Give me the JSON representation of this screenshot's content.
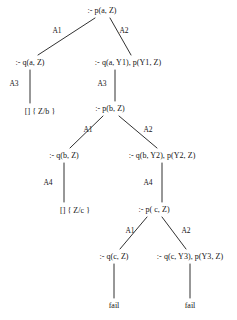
{
  "diagram": {
    "line_color": "#1a1a1a",
    "background_color": "#ffffff",
    "width": 237,
    "height": 320,
    "nodes": [
      {
        "id": "n0",
        "label": ":- p(a, Z)",
        "x": 102,
        "y": 10
      },
      {
        "id": "n1",
        "label": ":- q(a, Z)",
        "x": 30,
        "y": 62
      },
      {
        "id": "n2",
        "label": ":- q(a, Y1), p(Y1, Z)",
        "x": 128,
        "y": 62
      },
      {
        "id": "n3",
        "label": "[] { Z/b }",
        "x": 40,
        "y": 111
      },
      {
        "id": "n4",
        "label": ":- p(b, Z)",
        "x": 110,
        "y": 108
      },
      {
        "id": "n5",
        "label": ":- q(b, Z)",
        "x": 64,
        "y": 155
      },
      {
        "id": "n6",
        "label": ":- q(b, Y2), p(Y2, Z)",
        "x": 162,
        "y": 155
      },
      {
        "id": "n7",
        "label": "[] { Z/c }",
        "x": 75,
        "y": 210
      },
      {
        "id": "n8",
        "label": ":- p( c, Z)",
        "x": 154,
        "y": 209
      },
      {
        "id": "n9",
        "label": ":- q(c, Z)",
        "x": 114,
        "y": 256
      },
      {
        "id": "n10",
        "label": ":- q(c, Y3), p(Y3, Z)",
        "x": 190,
        "y": 256
      }
    ],
    "leaves": [
      {
        "id": "l0",
        "label": "fail",
        "x": 114,
        "y": 305
      },
      {
        "id": "l1",
        "label": "fail",
        "x": 190,
        "y": 305
      }
    ],
    "edges": [
      {
        "from": "n0",
        "to": "n1",
        "label": "A1",
        "lx": 57,
        "ly": 31,
        "x1": 95,
        "y1": 18,
        "x2": 38,
        "y2": 55
      },
      {
        "from": "n0",
        "to": "n2",
        "label": "A2",
        "lx": 124,
        "ly": 31,
        "x1": 110,
        "y1": 18,
        "x2": 131,
        "y2": 55
      },
      {
        "from": "n1",
        "to": "n3",
        "label": "A3",
        "lx": 14,
        "ly": 84,
        "x1": 30,
        "y1": 70,
        "x2": 30,
        "y2": 103
      },
      {
        "from": "n2",
        "to": "n4",
        "label": "A3",
        "lx": 102,
        "ly": 84,
        "x1": 115,
        "y1": 70,
        "x2": 115,
        "y2": 101
      },
      {
        "from": "n4",
        "to": "n5",
        "label": "A1",
        "lx": 88,
        "ly": 130,
        "x1": 103,
        "y1": 116,
        "x2": 70,
        "y2": 148
      },
      {
        "from": "n4",
        "to": "n6",
        "label": "A2",
        "lx": 148,
        "ly": 130,
        "x1": 119,
        "y1": 116,
        "x2": 157,
        "y2": 148
      },
      {
        "from": "n5",
        "to": "n7",
        "label": "A4",
        "lx": 48,
        "ly": 183,
        "x1": 64,
        "y1": 163,
        "x2": 64,
        "y2": 202
      },
      {
        "from": "n6",
        "to": "n8",
        "label": "A4",
        "lx": 148,
        "ly": 183,
        "x1": 162,
        "y1": 163,
        "x2": 162,
        "y2": 202
      },
      {
        "from": "n8",
        "to": "n9",
        "label": "A1",
        "lx": 130,
        "ly": 231,
        "x1": 147,
        "y1": 217,
        "x2": 120,
        "y2": 249
      },
      {
        "from": "n8",
        "to": "n10",
        "label": "A2",
        "lx": 186,
        "ly": 231,
        "x1": 162,
        "y1": 217,
        "x2": 186,
        "y2": 249
      },
      {
        "from": "n9",
        "to": "l0",
        "label": "",
        "lx": 0,
        "ly": 0,
        "x1": 114,
        "y1": 264,
        "x2": 114,
        "y2": 298
      },
      {
        "from": "n10",
        "to": "l1",
        "label": "",
        "lx": 0,
        "ly": 0,
        "x1": 190,
        "y1": 264,
        "x2": 190,
        "y2": 298
      }
    ]
  }
}
